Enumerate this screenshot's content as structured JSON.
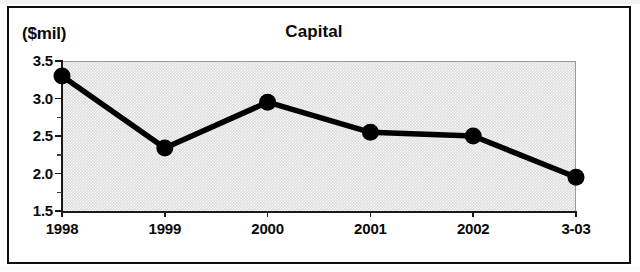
{
  "frame": {
    "units_label": "($mil)"
  },
  "chart_data": {
    "type": "line",
    "title": "Capital",
    "xlabel": "",
    "ylabel": "($mil)",
    "categories": [
      "1998",
      "1999",
      "2000",
      "2001",
      "2002",
      "3-03"
    ],
    "values": [
      3.3,
      2.34,
      2.95,
      2.55,
      2.5,
      1.95
    ],
    "series": [
      {
        "name": "Capital",
        "values": [
          3.3,
          2.34,
          2.95,
          2.55,
          2.5,
          1.95
        ]
      }
    ],
    "ylim": [
      1.5,
      3.5
    ],
    "ytick_labels": [
      "3.5",
      "3.0",
      "2.5",
      "2.0",
      "1.5"
    ],
    "ytick_values": [
      3.5,
      3.0,
      2.5,
      2.0,
      1.5
    ],
    "yminor_values": [
      3.25,
      2.75,
      2.25,
      1.75
    ],
    "grid": false,
    "legend": "none",
    "plot_background": "#dddddd",
    "line_color": "#000000",
    "marker_color": "#000000"
  }
}
